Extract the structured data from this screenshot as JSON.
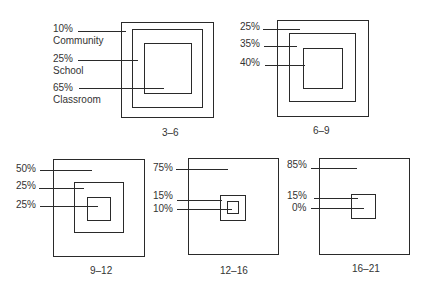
{
  "figure": {
    "panels": [
      {
        "age_range": "3–6",
        "levels": [
          {
            "percent": "10%",
            "name": "Community"
          },
          {
            "percent": "25%",
            "name": "School"
          },
          {
            "percent": "65%",
            "name": "Classroom"
          }
        ]
      },
      {
        "age_range": "6–9",
        "levels": [
          {
            "percent": "25%"
          },
          {
            "percent": "35%"
          },
          {
            "percent": "40%"
          }
        ]
      },
      {
        "age_range": "9–12",
        "levels": [
          {
            "percent": "50%"
          },
          {
            "percent": "25%"
          },
          {
            "percent": "25%"
          }
        ]
      },
      {
        "age_range": "12–16",
        "levels": [
          {
            "percent": "75%"
          },
          {
            "percent": "15%"
          },
          {
            "percent": "10%"
          }
        ]
      },
      {
        "age_range": "16–21",
        "levels": [
          {
            "percent": "85%"
          },
          {
            "percent": "15%"
          },
          {
            "percent": "0%"
          }
        ]
      }
    ]
  }
}
